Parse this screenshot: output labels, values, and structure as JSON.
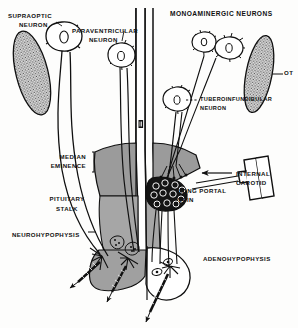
{
  "figure": {
    "type": "anatomical-schematic",
    "background_color": "#fdfdfc",
    "ink_color": "#101010"
  },
  "labels": {
    "supraoptic_neuron": "SUPRAOPTIC\nNEURON",
    "supraoptic_neuron_l1": "SUPRAOPTIC",
    "supraoptic_neuron_l2": "NEURON",
    "paraventricular_neuron_l1": "PARAVENTRICULAR",
    "paraventricular_neuron_l2": "NEURON",
    "monoaminergic_neurons": "MONOAMINERGIC   NEURONS",
    "optic_tract": "OT",
    "tuberoinfundibular_neuron_l1": "TUBEROINFUNDIBULAR",
    "tuberoinfundibular_neuron_l2": "NEURON",
    "median_eminence_l1": "MEDIAN",
    "median_eminence_l2": "EMINENCE",
    "third_ventricle": "III",
    "internal_carotid_l1": "INTERNAL",
    "internal_carotid_l2": "CAROTID",
    "long_portal_vein_l1": "LONG PORTAL",
    "long_portal_vein_l2": "VEIN",
    "pituitary_stalk_l1": "PITUITARY",
    "pituitary_stalk_l2": "STALK",
    "neurohypophysis": "NEUROHYPOPHYSIS",
    "adenohypophysis": "ADENOHYPOPHYSIS"
  },
  "colors": {
    "median_eminence_gray": "#9b9b9b",
    "stalk_gray": "#a6a6a6",
    "neurohypophysis_gray": "#a0a0a0",
    "optic_tract_stipple": "#bdbdbd",
    "adenohypophysis_fill": "#ffffff",
    "capillary_plexus": "#1a1a1a",
    "outline": "#101010"
  },
  "structures": [
    {
      "name": "supraoptic-neuron",
      "kind": "neuron-cell-body",
      "region": "hypothalamus-left"
    },
    {
      "name": "paraventricular-neuron",
      "kind": "neuron-cell-body",
      "region": "hypothalamus-left"
    },
    {
      "name": "monoaminergic-neurons",
      "kind": "neuron-cell-body-pair",
      "region": "hypothalamus-right"
    },
    {
      "name": "tuberoinfundibular-neuron",
      "kind": "neuron-cell-body",
      "region": "hypothalamus-right"
    },
    {
      "name": "optic-tract-left",
      "kind": "stippled-oval",
      "region": "left"
    },
    {
      "name": "optic-tract-right",
      "kind": "stippled-oval",
      "region": "right"
    },
    {
      "name": "third-ventricle",
      "kind": "midline-canal",
      "region": "midline"
    },
    {
      "name": "median-eminence",
      "kind": "shaded-zone",
      "region": "infundibulum"
    },
    {
      "name": "pituitary-stalk",
      "kind": "shaded-column",
      "region": "infundibulum"
    },
    {
      "name": "primary-capillary-plexus",
      "kind": "dark-cell-cluster",
      "region": "median-eminence"
    },
    {
      "name": "long-portal-vein",
      "kind": "vessel-pair",
      "region": "stalk"
    },
    {
      "name": "internal-carotid",
      "kind": "vessel-outline",
      "region": "right"
    },
    {
      "name": "neurohypophysis",
      "kind": "shaded-lobe",
      "region": "posterior-pituitary"
    },
    {
      "name": "adenohypophysis",
      "kind": "outlined-lobe",
      "region": "anterior-pituitary"
    }
  ]
}
